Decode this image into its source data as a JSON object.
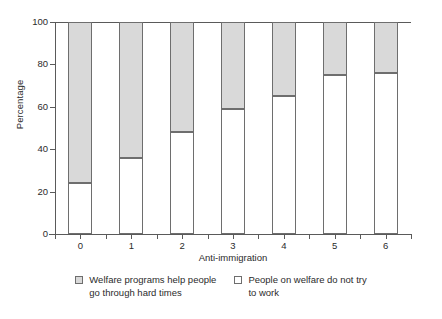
{
  "chart_data": {
    "type": "bar",
    "subtype": "stacked-percentage",
    "title": "",
    "xlabel": "Anti-immigration",
    "ylabel": "Percentage",
    "categories": [
      "0",
      "1",
      "2",
      "3",
      "4",
      "5",
      "6"
    ],
    "ylim": [
      0,
      100
    ],
    "yticks": [
      0,
      20,
      40,
      60,
      80,
      100
    ],
    "ytick_labels": [
      "0",
      "20",
      "40",
      "60",
      "80",
      "100"
    ],
    "grid": false,
    "legend_position": "bottom",
    "series": [
      {
        "name": "People on welfare do not try to work",
        "color": "#ffffff",
        "stack_position": "bottom",
        "values": [
          24,
          36,
          48,
          59,
          65,
          75,
          76
        ]
      },
      {
        "name": "Welfare programs help people go through hard times",
        "color": "#d9d9d9",
        "stack_position": "top",
        "values": [
          76,
          64,
          52,
          41,
          35,
          25,
          24
        ]
      }
    ]
  },
  "axis": {
    "y_title": "Percentage",
    "x_title": "Anti-immigration"
  },
  "legend": {
    "items": [
      {
        "swatch": "gray",
        "label": "Welfare programs help people\ngo through hard times"
      },
      {
        "swatch": "white",
        "label": "People on welfare do not try\nto work"
      }
    ]
  },
  "colors": {
    "segment_top": "#d9d9d9",
    "segment_bottom": "#ffffff",
    "outline": "#6e6e6e",
    "axis": "#5a5a5a",
    "text": "#2b2b2b",
    "background": "#ffffff"
  }
}
